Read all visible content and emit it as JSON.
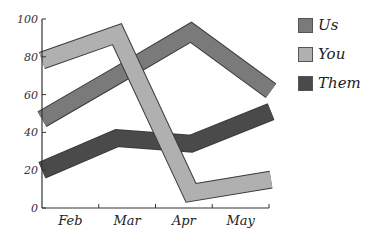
{
  "chart_data": {
    "type": "line",
    "title": "",
    "xlabel": "",
    "ylabel": "",
    "categories": [
      "Feb",
      "Mar",
      "Apr",
      "May"
    ],
    "ylim": [
      0,
      100
    ],
    "yticks": [
      0,
      20,
      40,
      60,
      80,
      100
    ],
    "grid": false,
    "legend_position": "right",
    "series": [
      {
        "name": "Us",
        "color": "#7a7a7a",
        "values": [
          47,
          70,
          93,
          62
        ]
      },
      {
        "name": "You",
        "color": "#b0b0b0",
        "values": [
          78,
          92,
          8,
          15
        ]
      },
      {
        "name": "Them",
        "color": "#4a4a4a",
        "values": [
          20,
          37,
          34,
          51
        ]
      }
    ]
  },
  "axis": {
    "yticks": [
      "0",
      "20",
      "40",
      "60",
      "80",
      "100"
    ],
    "xticks": [
      "Feb",
      "Mar",
      "Apr",
      "May"
    ]
  },
  "legend": {
    "items": [
      {
        "label": "Us",
        "color": "#7a7a7a"
      },
      {
        "label": "You",
        "color": "#b0b0b0"
      },
      {
        "label": "Them",
        "color": "#4a4a4a"
      }
    ]
  }
}
